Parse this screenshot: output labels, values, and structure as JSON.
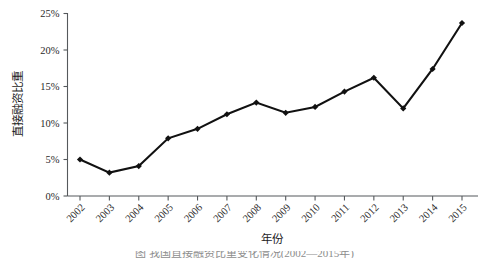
{
  "chart_data": {
    "type": "line",
    "title": "",
    "xlabel": "年份",
    "ylabel": "直接融资比重",
    "categories": [
      "2002",
      "2003",
      "2004",
      "2005",
      "2006",
      "2007",
      "2008",
      "2009",
      "2010",
      "2011",
      "2012",
      "2013",
      "2014",
      "2015"
    ],
    "values": [
      5.0,
      3.2,
      4.1,
      7.9,
      9.2,
      11.2,
      12.8,
      11.4,
      12.2,
      14.3,
      16.2,
      12.0,
      17.4,
      23.7
    ],
    "series": [
      {
        "name": "直接融资比重",
        "values": [
          5.0,
          3.2,
          4.1,
          7.9,
          9.2,
          11.2,
          12.8,
          11.4,
          12.2,
          14.3,
          16.2,
          12.0,
          17.4,
          23.7
        ]
      }
    ],
    "ylim": [
      0,
      25
    ],
    "ytick_labels": [
      "0%",
      "5%",
      "10%",
      "15%",
      "20%",
      "25%"
    ],
    "ytick_values": [
      0,
      5,
      10,
      15,
      20,
      25
    ],
    "xtick_labels": [
      "2002",
      "2003",
      "2004",
      "2005",
      "2006",
      "2007",
      "2008",
      "2009",
      "2010",
      "2011",
      "2012",
      "2013",
      "2014",
      "2015"
    ],
    "xtick_rotation": -45,
    "grid": false,
    "legend": false,
    "marker": "diamond",
    "line_color": "#111111",
    "axis_color": "#55595c"
  },
  "caption": {
    "text": "图  我国直接融资比重变化情况(2002—2015年)"
  }
}
